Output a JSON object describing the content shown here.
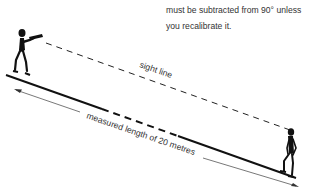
{
  "caption": {
    "line1": "must be subtracted from 90° unless",
    "line2": "you recalibrate it."
  },
  "diagram": {
    "sight_line_label": "sight line",
    "measured_label": "measured length of 20 metres",
    "colors": {
      "ink": "#111111",
      "text": "#333333",
      "arrow": "#555555"
    }
  }
}
